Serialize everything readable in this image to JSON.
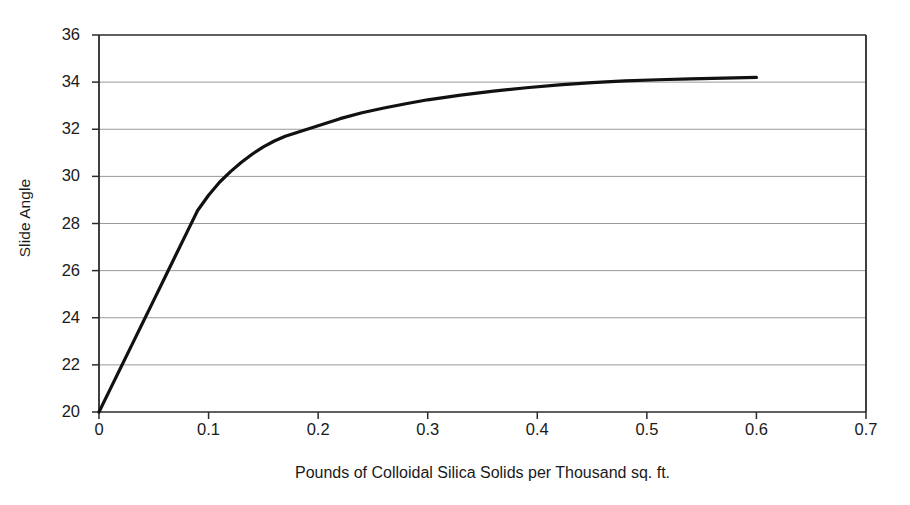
{
  "chart_data": {
    "type": "line",
    "title": "",
    "xlabel": "Pounds of Colloidal Silica Solids per Thousand sq. ft.",
    "ylabel": "Slide Angle",
    "xlim": [
      0,
      0.7
    ],
    "ylim": [
      20,
      36
    ],
    "xticks": [
      "0",
      "0.1",
      "0.2",
      "0.3",
      "0.4",
      "0.5",
      "0.6",
      "0.7"
    ],
    "xtick_values": [
      0,
      0.1,
      0.2,
      0.3,
      0.4,
      0.5,
      0.6,
      0.7
    ],
    "yticks": [
      "20",
      "22",
      "24",
      "26",
      "28",
      "30",
      "32",
      "34",
      "36"
    ],
    "ytick_values": [
      20,
      22,
      24,
      26,
      28,
      30,
      32,
      34,
      36
    ],
    "grid": "horizontal",
    "legend": "none",
    "series": [
      {
        "name": "Slide Angle vs Colloidal Silica",
        "color": "#111111",
        "line_width": 3.2,
        "x": [
          0.0,
          0.01,
          0.02,
          0.03,
          0.04,
          0.05,
          0.06,
          0.07,
          0.08,
          0.09,
          0.1,
          0.11,
          0.12,
          0.13,
          0.14,
          0.15,
          0.16,
          0.17,
          0.18,
          0.2,
          0.22,
          0.24,
          0.26,
          0.28,
          0.3,
          0.33,
          0.36,
          0.39,
          0.42,
          0.45,
          0.48,
          0.51,
          0.54,
          0.57,
          0.6
        ],
        "y": [
          20.0,
          20.95,
          21.9,
          22.85,
          23.8,
          24.75,
          25.7,
          26.65,
          27.6,
          28.55,
          29.2,
          29.75,
          30.2,
          30.6,
          30.95,
          31.25,
          31.5,
          31.7,
          31.85,
          32.15,
          32.45,
          32.7,
          32.9,
          33.08,
          33.25,
          33.45,
          33.62,
          33.76,
          33.88,
          33.98,
          34.05,
          34.1,
          34.14,
          34.17,
          34.2
        ]
      }
    ]
  },
  "axes": {
    "y_title": "Slide Angle",
    "x_title": "Pounds of Colloidal Silica Solids per Thousand sq. ft."
  },
  "style": {
    "line_color": "#111111",
    "axis_color": "#2b2b2b",
    "grid_color": "#9a9a9a",
    "background": "#ffffff"
  }
}
